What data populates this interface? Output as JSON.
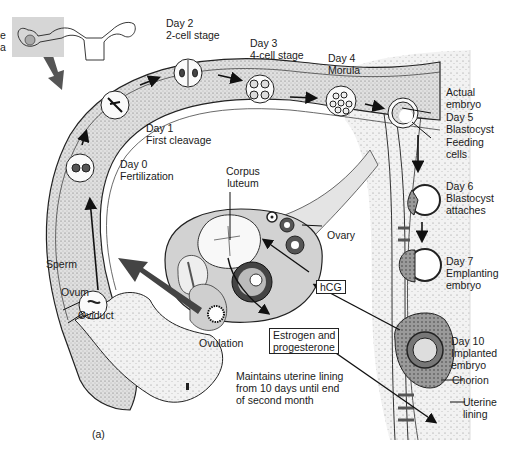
{
  "figure": {
    "panel_label": "(a)",
    "left_edge_fragments": [
      "e",
      "a"
    ]
  },
  "stages": [
    {
      "day": "Day 0",
      "name": "Fertilization"
    },
    {
      "day": "Day 1",
      "name": "First cleavage"
    },
    {
      "day": "Day 2",
      "name": "2-cell stage"
    },
    {
      "day": "Day 3",
      "name": "4-cell stage"
    },
    {
      "day": "Day 4",
      "name": "Morula"
    },
    {
      "day": "Day 5",
      "name": "Blastocyst"
    },
    {
      "day": "Day 6",
      "name": "Blastocyst\nattaches"
    },
    {
      "day": "Day 7",
      "name": "Emplanting\nembryo"
    },
    {
      "day": "Day 10",
      "name": "Implanted\nembryo"
    }
  ],
  "structures": {
    "actual_embryo": "Actual\nembryo",
    "feeding_cells": "Feeding\ncells",
    "corpus_luteum": "Corpus\nluteum",
    "ovary": "Ovary",
    "sperm": "Sperm",
    "ovum": "Ovum",
    "oviduct": "Oviduct",
    "ovulation": "Ovulation",
    "chorion": "Chorion",
    "uterine_lining": "Uterine\nlining"
  },
  "hormones": {
    "hcg": "hCG",
    "estrogen_progesterone": "Estrogen and\nprogesterone",
    "maintains_note": "Maintains uterine lining\nfrom 10 days until end\nof second month"
  },
  "colors": {
    "ink": "#1a1a1a",
    "tissue_light": "#ececec",
    "tissue_mid": "#c8c8c8",
    "tissue_dark": "#8a8a8a",
    "background": "#ffffff"
  }
}
